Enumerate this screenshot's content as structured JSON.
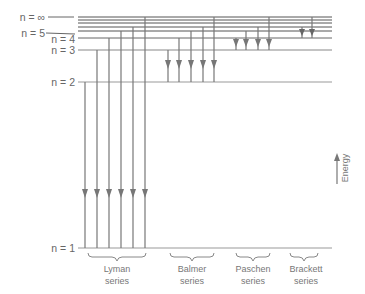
{
  "diagram": {
    "level_labels": {
      "n_inf": "n = ∞",
      "n5": "n = 5",
      "n4": "n = 4",
      "n3": "n = 3",
      "n2": "n = 2",
      "n1": "n = 1"
    },
    "levels": [
      {
        "n": "1",
        "y": 248
      },
      {
        "n": "2",
        "y": 82
      },
      {
        "n": "3",
        "y": 50
      },
      {
        "n": "4",
        "y": 38
      },
      {
        "n": "5",
        "y": 31
      },
      {
        "n": "6",
        "y": 27
      },
      {
        "n": "7",
        "y": 23
      },
      {
        "n": "8",
        "y": 20
      },
      {
        "n": "∞",
        "y": 17
      }
    ],
    "series": [
      {
        "name": "Lyman",
        "line1": "Lyman",
        "line2": "series",
        "final_level": "1",
        "transitions_from": [
          "2",
          "3",
          "4",
          "5",
          "6",
          "∞"
        ]
      },
      {
        "name": "Balmer",
        "line1": "Balmer",
        "line2": "series",
        "final_level": "2",
        "transitions_from": [
          "3",
          "4",
          "5",
          "6",
          "∞"
        ]
      },
      {
        "name": "Paschen",
        "line1": "Paschen",
        "line2": "series",
        "final_level": "3",
        "transitions_from": [
          "4",
          "5",
          "6",
          "∞"
        ]
      },
      {
        "name": "Brackett",
        "line1": "Brackett",
        "line2": "series",
        "final_level": "4",
        "transitions_from": [
          "5",
          "∞"
        ]
      }
    ],
    "energy_axis_label": "Energy",
    "colors": {
      "upper_levels": "#555555",
      "lower_levels": "#9a9a9a",
      "arrows": "#777777",
      "labels": "#666666"
    }
  }
}
